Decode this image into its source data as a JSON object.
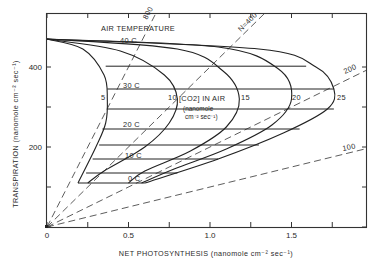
{
  "chart_data": {
    "type": "line",
    "title": "",
    "xlabel": "NET PHOTOSYNTHESIS (nanomole cm⁻² sec⁻¹)",
    "ylabel": "TRANSPIRATION (nanomole cm⁻² sec⁻¹)",
    "xlim": [
      0,
      1.96
    ],
    "ylim": [
      0,
      535
    ],
    "grid": false,
    "legend": "none",
    "x_ticks": [
      0,
      0.25,
      0.5,
      0.75,
      1.0,
      1.25,
      1.5,
      1.75
    ],
    "x_tick_labels": [
      "0",
      "",
      "0.5",
      "",
      "1.0",
      "",
      "1.5",
      ""
    ],
    "y_ticks": [
      0,
      100,
      200,
      300,
      400
    ],
    "y_tick_labels": [
      "0",
      "",
      "200",
      "",
      "400"
    ],
    "annotations": {
      "air_temperature_title": "AIR TEMPERATURE",
      "co2_title": "[CO2] IN AIR",
      "co2_units_1": "(nanomole",
      "co2_units_2": "cm⁻² sec⁻¹)"
    },
    "co2_curves": [
      {
        "label": "5",
        "points": [
          [
            -0.005,
            470
          ],
          [
            0.22,
            445
          ],
          [
            0.35,
            380
          ],
          [
            0.37,
            320
          ],
          [
            0.36,
            260
          ],
          [
            0.3,
            200
          ],
          [
            0.19,
            110
          ]
        ]
      },
      {
        "label": "10",
        "points": [
          [
            -0.005,
            470
          ],
          [
            0.45,
            440
          ],
          [
            0.72,
            380
          ],
          [
            0.8,
            320
          ],
          [
            0.75,
            260
          ],
          [
            0.6,
            200
          ],
          [
            0.35,
            140
          ],
          [
            0.25,
            110
          ]
        ]
      },
      {
        "label": "15",
        "points": [
          [
            -0.005,
            470
          ],
          [
            0.8,
            445
          ],
          [
            1.08,
            390
          ],
          [
            1.18,
            320
          ],
          [
            1.1,
            250
          ],
          [
            0.88,
            190
          ],
          [
            0.6,
            140
          ],
          [
            0.5,
            110
          ]
        ]
      },
      {
        "label": "20",
        "points": [
          [
            -0.005,
            470
          ],
          [
            1.05,
            450
          ],
          [
            1.42,
            395
          ],
          [
            1.5,
            320
          ],
          [
            1.38,
            255
          ],
          [
            1.1,
            195
          ],
          [
            0.78,
            145
          ],
          [
            0.58,
            110
          ]
        ]
      },
      {
        "label": "25",
        "points": [
          [
            -0.005,
            470
          ],
          [
            1.3,
            445
          ],
          [
            1.65,
            400
          ],
          [
            1.76,
            345
          ],
          [
            1.72,
            295
          ],
          [
            1.45,
            235
          ],
          [
            1.05,
            170
          ],
          [
            0.6,
            110
          ]
        ]
      }
    ],
    "temperature_lines": [
      {
        "label": "40 C",
        "T": 402,
        "P_start": 0.36,
        "P_end": 1.59
      },
      {
        "label": "",
        "T": 345,
        "P_start": 0.37,
        "P_end": 1.76
      },
      {
        "label": "30 C",
        "T": 295,
        "P_start": 0.37,
        "P_end": 1.76
      },
      {
        "label": "",
        "T": 245,
        "P_start": 0.34,
        "P_end": 1.55
      },
      {
        "label": "20 C",
        "T": 205,
        "P_start": 0.32,
        "P_end": 1.3
      },
      {
        "label": "",
        "T": 170,
        "P_start": 0.28,
        "P_end": 1.05
      },
      {
        "label": "10 C",
        "T": 135,
        "P_start": 0.24,
        "P_end": 0.8
      },
      {
        "label": "0 C",
        "T": 110,
        "P_start": 0.19,
        "P_end": 0.6
      }
    ],
    "temperature_label_text": [
      "40 C",
      "30 C",
      "20 C",
      "10 C",
      "0 C"
    ],
    "water_use_ratio_rays": [
      {
        "label": "800",
        "ratio": 800
      },
      {
        "label": "N=400",
        "ratio": 400
      },
      {
        "label": "200",
        "ratio": 200
      },
      {
        "label": "100",
        "ratio": 100
      }
    ],
    "curve_labels": [
      "5",
      "10",
      "15",
      "20",
      "25"
    ]
  }
}
